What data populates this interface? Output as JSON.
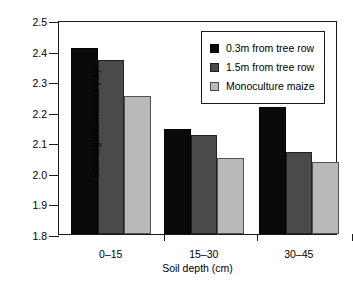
{
  "chart_data": {
    "type": "bar",
    "title": "",
    "xlabel": "Soil depth (cm)",
    "ylabel": "Soil organic matter (%)",
    "categories": [
      "0–15",
      "15–30",
      "30–45"
    ],
    "ylim": [
      1.8,
      2.5
    ],
    "yticks": [
      "2.5",
      "2.4",
      "2.3",
      "2.2",
      "2.1",
      "2.0",
      "1.9",
      "1.8"
    ],
    "ytick_values": [
      2.5,
      2.4,
      2.3,
      2.2,
      2.1,
      2.0,
      1.9,
      1.8
    ],
    "grid": false,
    "legend_position": "top-right-inside",
    "series": [
      {
        "name": "0.3m from tree row",
        "color": "#0a0a0a",
        "values": [
          2.41,
          2.145,
          2.215
        ]
      },
      {
        "name": "1.5m from tree row",
        "color": "#4a4a4a",
        "values": [
          2.37,
          2.125,
          2.068
        ]
      },
      {
        "name": "Monoculture maize",
        "color": "#b9b9b9",
        "values": [
          2.25,
          2.048,
          2.037
        ]
      }
    ]
  }
}
